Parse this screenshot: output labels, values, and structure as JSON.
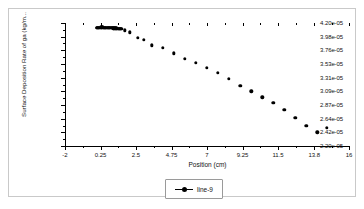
{
  "figure": {
    "background_color": "#ffffff",
    "frame_color": "#c9c9c9",
    "marker_color": "#000000"
  },
  "legend": {
    "position": "bottom-center",
    "entries": [
      {
        "label": "line-9",
        "marker": "filled-circle",
        "color": "#000000"
      }
    ]
  },
  "chart_data": {
    "type": "scatter",
    "title": "",
    "xlabel": "Position (cm)",
    "ylabel": "Surface Deposition Rate of ga (kg/m...",
    "xlim": [
      -2,
      16
    ],
    "ylim": [
      2.2e-05,
      4.2e-05
    ],
    "grid": false,
    "legend_position": "bottom-center",
    "xticklabels": [
      "-2",
      "0.25",
      "2.5",
      "4.75",
      "7",
      "9.25",
      "11.5",
      "13.8",
      "16"
    ],
    "xtickvalues": [
      -2,
      0.25,
      2.5,
      4.75,
      7,
      9.25,
      11.5,
      13.8,
      16
    ],
    "yticklabels": [
      "4.20e-05",
      "3.98e-05",
      "3.76e-05",
      "3.53e-05",
      "3.31e-05",
      "3.09e-05",
      "2.87e-05",
      "2.64e-05",
      "2.42e-05",
      "2.20e-05"
    ],
    "ytickvalues": [
      4.2e-05,
      3.98e-05,
      3.76e-05,
      3.53e-05,
      3.31e-05,
      3.09e-05,
      2.87e-05,
      2.64e-05,
      2.42e-05,
      2.2e-05
    ],
    "series": [
      {
        "name": "line-9",
        "marker": "filled-circle",
        "color": "#000000",
        "x": [
          0.0,
          0.05,
          0.1,
          0.15,
          0.2,
          0.25,
          0.3,
          0.35,
          0.4,
          0.45,
          0.5,
          0.55,
          0.6,
          0.65,
          0.7,
          0.75,
          0.8,
          0.85,
          0.9,
          0.95,
          1.0,
          1.05,
          1.1,
          1.15,
          1.2,
          1.25,
          1.3,
          1.35,
          1.4,
          1.45,
          1.5,
          1.55,
          1.6,
          1.8,
          2.1,
          2.6,
          3.0,
          3.5,
          4.2,
          4.9,
          5.6,
          6.3,
          7.0,
          7.7,
          8.4,
          9.1,
          9.8,
          10.5,
          11.2,
          11.9,
          12.6,
          13.3,
          14.0,
          14.6
        ],
        "y": [
          4.118e-05,
          4.12e-05,
          4.122e-05,
          4.124e-05,
          4.125e-05,
          4.126e-05,
          4.127e-05,
          4.127e-05,
          4.127e-05,
          4.126e-05,
          4.126e-05,
          4.125e-05,
          4.125e-05,
          4.124e-05,
          4.123e-05,
          4.122e-05,
          4.121e-05,
          4.12e-05,
          4.119e-05,
          4.118e-05,
          4.117e-05,
          4.116e-05,
          4.114e-05,
          4.113e-05,
          4.112e-05,
          4.111e-05,
          4.11e-05,
          4.109e-05,
          4.108e-05,
          4.107e-05,
          4.106e-05,
          4.105e-05,
          4.104e-05,
          4.08e-05,
          4.05e-05,
          3.96e-05,
          3.925e-05,
          3.84e-05,
          3.8e-05,
          3.71e-05,
          3.62e-05,
          3.555e-05,
          3.47e-05,
          3.39e-05,
          3.29e-05,
          3.18e-05,
          3.09e-05,
          2.99e-05,
          2.9e-05,
          2.79e-05,
          2.66e-05,
          2.525e-05,
          2.42e-05,
          2.5e-05
        ]
      }
    ]
  }
}
